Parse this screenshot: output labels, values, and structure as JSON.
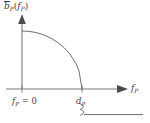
{
  "figure": {
    "kind": "line-plot-diagram",
    "background_color": "#ffffff",
    "ink_color": "#6f6f6f",
    "text_color": "#3d3d3d"
  },
  "axes": {
    "y_axis": {
      "name": "vertical-axis",
      "label_plain": "b̄_P(f_P)",
      "label_symbol": "b",
      "label_overbar": true,
      "label_subscript": "P",
      "label_argument_symbol": "f",
      "label_argument_subscript": "P",
      "has_arrowhead": true,
      "arrow_direction": "up"
    },
    "x_axis": {
      "name": "horizontal-axis",
      "label_plain": "f_P",
      "label_symbol": "f",
      "label_subscript": "P",
      "has_arrowhead": true,
      "arrow_direction": "right"
    }
  },
  "ticks": [
    {
      "name": "origin-tick",
      "label_plain": "f_P = 0",
      "symbol": "f",
      "subscript": "P",
      "relation": "=",
      "value": "0",
      "position_x": 22
    },
    {
      "name": "dp-tick",
      "label_plain": "d_P",
      "symbol": "d",
      "subscript": "P",
      "value": "",
      "position_x": 82
    }
  ],
  "annotations": {
    "axis_break": {
      "name": "axis-break-squiggle",
      "glyph": "squiggle",
      "description": "axis break marker below horizontal axis at d_P"
    }
  },
  "chart_data": {
    "type": "line",
    "title": "",
    "xlabel": "f_P",
    "ylabel": "b̄_P(f_P)",
    "grid": false,
    "legend": "none",
    "xlim": [
      0,
      1
    ],
    "ylim": [
      0,
      1
    ],
    "x_tick_labels": [
      "f_P = 0",
      "d_P"
    ],
    "x_tick_values": [
      0,
      1
    ],
    "series": [
      {
        "name": "b-bar-P",
        "shape": "concave-decreasing-quarter-ellipse",
        "x": [
          0.0,
          0.1,
          0.2,
          0.3,
          0.4,
          0.5,
          0.6,
          0.7,
          0.8,
          0.9,
          0.95,
          1.0
        ],
        "y": [
          1.0,
          0.995,
          0.98,
          0.954,
          0.917,
          0.866,
          0.8,
          0.714,
          0.6,
          0.436,
          0.312,
          0.0
        ]
      }
    ]
  }
}
